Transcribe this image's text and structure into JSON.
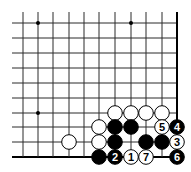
{
  "diagram": {
    "type": "go-board-fragment",
    "corner": "bottom-right",
    "columns": 11,
    "rows": 10,
    "col_x": [
      23,
      38,
      53,
      69,
      84,
      99,
      115,
      131,
      146,
      162,
      177
    ],
    "row_y": [
      23,
      38,
      53,
      68,
      83,
      98,
      113,
      127,
      142,
      157
    ],
    "colors": {
      "line": "#2a2a2a",
      "edge": "#000000",
      "black_stone": "#000000",
      "white_stone": "#ffffff",
      "stone_outline": "#000000"
    },
    "star_points": [
      {
        "col": 1,
        "row": 0
      },
      {
        "col": 7,
        "row": 0
      },
      {
        "col": 1,
        "row": 6
      }
    ],
    "stones": [
      {
        "col": 6,
        "row": 6,
        "color": "white",
        "label": ""
      },
      {
        "col": 7,
        "row": 6,
        "color": "white",
        "label": ""
      },
      {
        "col": 8,
        "row": 6,
        "color": "white",
        "label": ""
      },
      {
        "col": 9,
        "row": 6,
        "color": "white",
        "label": ""
      },
      {
        "col": 5,
        "row": 7,
        "color": "white",
        "label": ""
      },
      {
        "col": 6,
        "row": 7,
        "color": "black",
        "label": ""
      },
      {
        "col": 7,
        "row": 7,
        "color": "black",
        "label": ""
      },
      {
        "col": 9,
        "row": 7,
        "color": "white",
        "label": "5"
      },
      {
        "col": 10,
        "row": 7,
        "color": "black",
        "label": "4"
      },
      {
        "col": 3,
        "row": 8,
        "color": "white",
        "label": ""
      },
      {
        "col": 5,
        "row": 8,
        "color": "white",
        "label": ""
      },
      {
        "col": 6,
        "row": 8,
        "color": "black",
        "label": ""
      },
      {
        "col": 8,
        "row": 8,
        "color": "black",
        "label": ""
      },
      {
        "col": 9,
        "row": 8,
        "color": "black",
        "label": ""
      },
      {
        "col": 10,
        "row": 8,
        "color": "white",
        "label": "3"
      },
      {
        "col": 5,
        "row": 9,
        "color": "black",
        "label": ""
      },
      {
        "col": 6,
        "row": 9,
        "color": "black",
        "label": "2"
      },
      {
        "col": 7,
        "row": 9,
        "color": "white",
        "label": "1"
      },
      {
        "col": 8,
        "row": 9,
        "color": "white",
        "label": "7"
      },
      {
        "col": 10,
        "row": 9,
        "color": "black",
        "label": "6"
      }
    ]
  }
}
